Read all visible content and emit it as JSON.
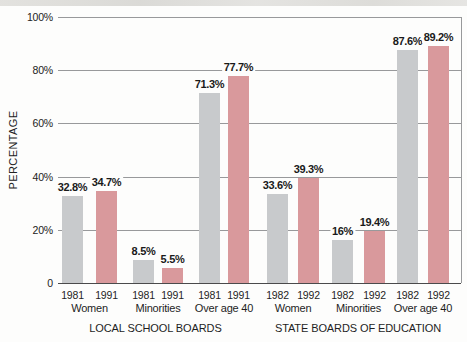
{
  "colors": {
    "bar_first_year": "#c8cacc",
    "bar_second_year": "#d9999c",
    "gridline": "#98999b",
    "axis_line": "#4a4a4b",
    "text": "#1f1f1f",
    "background": "#fdfdfc"
  },
  "chart_data": {
    "type": "bar",
    "title": "",
    "xlabel": "",
    "ylabel": "PERCENTAGE",
    "ylim": [
      0,
      100
    ],
    "grid": true,
    "legend": "none",
    "yticks": [
      {
        "value": 0,
        "label": "0"
      },
      {
        "value": 20,
        "label": "20%"
      },
      {
        "value": 40,
        "label": "40%"
      },
      {
        "value": 60,
        "label": "60%"
      },
      {
        "value": 80,
        "label": "80%"
      },
      {
        "value": 100,
        "label": "100%"
      }
    ],
    "groups": [
      {
        "label": "LOCAL SCHOOL BOARDS",
        "pairs": [
          {
            "category": "Women",
            "bars": [
              {
                "year": "1981",
                "value": 32.8,
                "label": "32.8%"
              },
              {
                "year": "1991",
                "value": 34.7,
                "label": "34.7%"
              }
            ]
          },
          {
            "category": "Minorities",
            "bars": [
              {
                "year": "1981",
                "value": 8.5,
                "label": "8.5%"
              },
              {
                "year": "1991",
                "value": 5.5,
                "label": "5.5%"
              }
            ]
          },
          {
            "category": "Over age 40",
            "bars": [
              {
                "year": "1981",
                "value": 71.3,
                "label": "71.3%"
              },
              {
                "year": "1991",
                "value": 77.7,
                "label": "77.7%"
              }
            ]
          }
        ]
      },
      {
        "label": "STATE BOARDS OF EDUCATION",
        "pairs": [
          {
            "category": "Women",
            "bars": [
              {
                "year": "1982",
                "value": 33.6,
                "label": "33.6%"
              },
              {
                "year": "1992",
                "value": 39.3,
                "label": "39.3%"
              }
            ]
          },
          {
            "category": "Minorities",
            "bars": [
              {
                "year": "1982",
                "value": 16,
                "label": "16%"
              },
              {
                "year": "1992",
                "value": 19.4,
                "label": "19.4%"
              }
            ]
          },
          {
            "category": "Over age 40",
            "bars": [
              {
                "year": "1982",
                "value": 87.6,
                "label": "87.6%"
              },
              {
                "year": "1992",
                "value": 89.2,
                "label": "89.2%"
              }
            ]
          }
        ]
      }
    ]
  }
}
